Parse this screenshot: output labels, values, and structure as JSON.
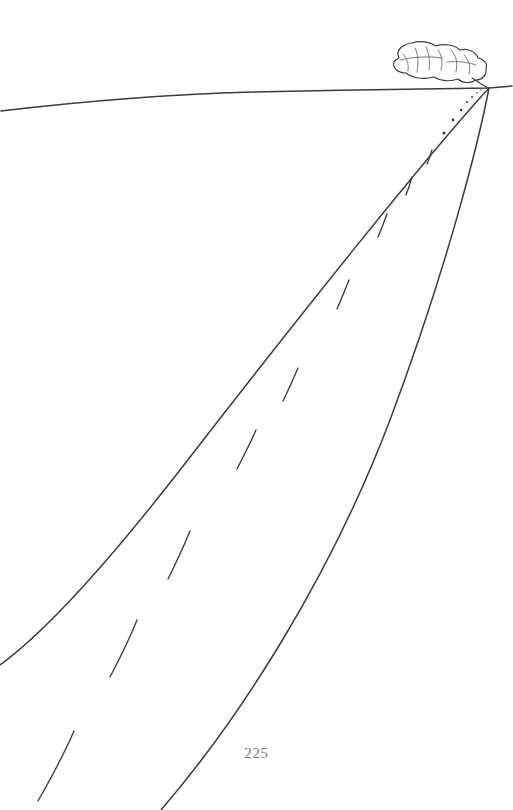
{
  "page": {
    "number": "225",
    "width": 513,
    "height": 810,
    "background_color": "#ffffff"
  },
  "illustration": {
    "title": "Road receding to vanishing point with smoke plume",
    "ink_color": "#3b3b42",
    "detail_ink_color": "#6a6a72",
    "vanishing_point": {
      "x": 489,
      "y": 88
    },
    "horizon": {
      "name": "horizon-line",
      "path": "M 1 111 C 60 104, 150 95, 252 92 C 330 90, 420 89, 489 88 L 512 86"
    },
    "road": {
      "left_edge": {
        "name": "road-left-edge",
        "path": "M 489 88 C 430 152, 300 315, 180 470 C 110 560, 45 632, 0 665"
      },
      "right_edge": {
        "name": "road-right-edge",
        "path": "M 489 88 C 480 135, 450 260, 390 420 C 330 578, 240 718, 161 810"
      }
    },
    "center_line": {
      "name": "center-line-dashes",
      "dashes": [
        {
          "path": "M 74 731 C 64 754, 50 780, 38 801"
        },
        {
          "path": "M 137 620 C 129 640, 119 660, 110 677"
        },
        {
          "path": "M 190 531 C 183 548, 175 565, 168 579"
        },
        {
          "path": "M 256 430 C 250 444, 243 457, 237 469"
        },
        {
          "path": "M 298 368 C 293 380, 288 391, 283 401"
        },
        {
          "path": "M 349 280 C 345 290, 341 300, 337 309"
        },
        {
          "path": "M 387 214 C 384 222, 381 230, 378 237"
        },
        {
          "path": "M 412 177 C 410 184, 408 190, 406 195"
        },
        {
          "path": "M 432 150 C 430 155, 429 160, 427 164"
        }
      ],
      "dots": [
        {
          "cx": 444,
          "cy": 133,
          "r": 1.5
        },
        {
          "cx": 453,
          "cy": 120,
          "r": 1.4
        },
        {
          "cx": 461,
          "cy": 110,
          "r": 1.25
        },
        {
          "cx": 467,
          "cy": 102,
          "r": 1.1
        },
        {
          "cx": 472,
          "cy": 97,
          "r": 0.95
        },
        {
          "cx": 477,
          "cy": 93,
          "r": 0.8
        },
        {
          "cx": 481,
          "cy": 90,
          "r": 0.65
        }
      ]
    },
    "smoke_plume": {
      "name": "smoke-plume",
      "outline": "M 399 58 C 395 51, 402 44, 412 43 C 420 40, 430 42, 436 46 C 444 43, 455 45, 460 50 C 468 48, 476 52, 478 58 C 484 59, 488 64, 486 69 C 487 75, 482 80, 476 80 C 470 84, 462 83, 458 79 C 450 82, 440 81, 434 77 C 424 80, 412 78, 406 73 C 398 73, 392 68, 394 62 C 395 60, 397 59, 399 58 Z",
      "details": [
        "M 403 54 C 407 58, 409 64, 408 71",
        "M 415 48 C 418 54, 419 62, 417 72",
        "M 426 47 C 429 53, 430 61, 429 70",
        "M 438 50 C 442 55, 443 62, 441 70",
        "M 451 50 C 456 55, 458 62, 456 72",
        "M 464 55 C 469 60, 471 66, 469 74",
        "M 400 60 C 412 57, 428 56, 442 58",
        "M 447 62 C 458 61, 468 62, 476 65"
      ],
      "stem": "M 472 78 C 478 82, 483 85, 488 88"
    }
  }
}
